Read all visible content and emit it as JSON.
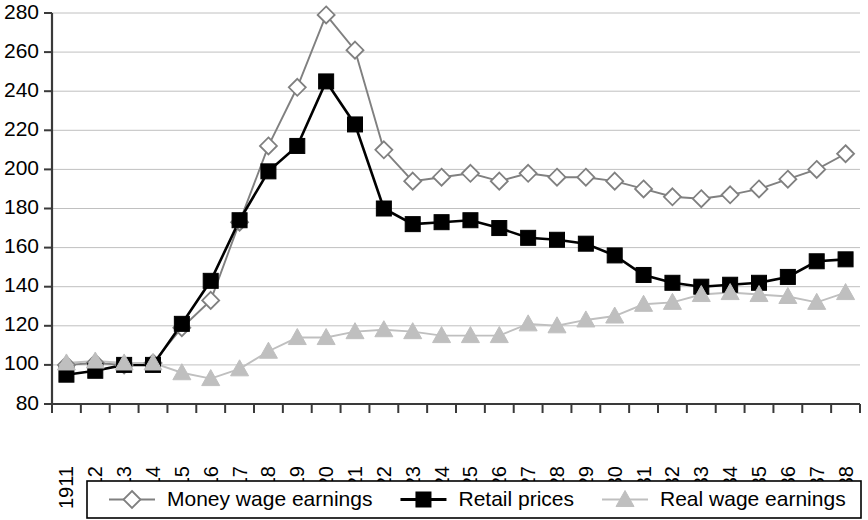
{
  "chart_data": {
    "type": "line",
    "title": "",
    "subtitle": "",
    "xlabel": "",
    "ylabel": "",
    "ylim": [
      80,
      280
    ],
    "ytick_step": 20,
    "yticks": [
      80,
      100,
      120,
      140,
      160,
      180,
      200,
      220,
      240,
      260,
      280
    ],
    "grid": true,
    "legend_position": "bottom",
    "categories": [
      "1911",
      "1912",
      "1913",
      "1914",
      "1915",
      "1916",
      "1917",
      "1918",
      "1919",
      "1920",
      "1921",
      "1922",
      "1923",
      "1924",
      "1925",
      "1926",
      "1927",
      "1928",
      "1929",
      "1930",
      "1931",
      "1932",
      "1933",
      "1934",
      "1935",
      "1936",
      "1937",
      "1938"
    ],
    "series": [
      {
        "name": "Money wage earnings",
        "color": "#808080",
        "marker": "diamond",
        "marker_fill": "#ffffff",
        "values": [
          100,
          101,
          100,
          101,
          119,
          133,
          173,
          212,
          242,
          279,
          261,
          210,
          194,
          196,
          198,
          194,
          198,
          196,
          196,
          194,
          190,
          186,
          185,
          187,
          190,
          195,
          200,
          208
        ]
      },
      {
        "name": "Retail prices",
        "color": "#000000",
        "marker": "square",
        "marker_fill": "#000000",
        "values": [
          95,
          97,
          100,
          100,
          121,
          143,
          174,
          199,
          212,
          245,
          223,
          180,
          172,
          173,
          174,
          170,
          165,
          164,
          162,
          156,
          146,
          142,
          140,
          141,
          142,
          145,
          153,
          154
        ]
      },
      {
        "name": "Real wage earnings",
        "color": "#bfbfbf",
        "marker": "triangle",
        "marker_fill": "#bfbfbf",
        "values": [
          101,
          102,
          101,
          101,
          96,
          93,
          98,
          107,
          114,
          114,
          117,
          118,
          117,
          115,
          115,
          115,
          121,
          120,
          123,
          125,
          131,
          132,
          136,
          137,
          136,
          135,
          132,
          137
        ]
      }
    ]
  },
  "legend": {
    "items": [
      {
        "label": "Money wage earnings"
      },
      {
        "label": "Retail prices"
      },
      {
        "label": "Real wage earnings"
      }
    ]
  }
}
